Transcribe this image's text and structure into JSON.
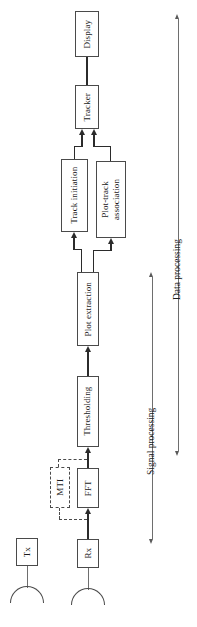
{
  "figure": {
    "type": "block-diagram",
    "orientation": "rotated-90-ccw",
    "background_color": "#ffffff",
    "line_color": "#2b2b2b",
    "box_border_color": "#4a4a4a",
    "blocks": [
      {
        "id": "display",
        "label": "Display",
        "style": "solid"
      },
      {
        "id": "tracker",
        "label": "Tracker",
        "style": "solid"
      },
      {
        "id": "track_init",
        "label": "Track initiation",
        "style": "solid"
      },
      {
        "id": "plot_track",
        "label": "Plot-track association",
        "style": "solid"
      },
      {
        "id": "plot_extract",
        "label": "Plot extraction",
        "style": "solid"
      },
      {
        "id": "thresholding",
        "label": "Thresholding",
        "style": "solid"
      },
      {
        "id": "mti",
        "label": "MTI",
        "style": "dashed"
      },
      {
        "id": "fft",
        "label": "FFT",
        "style": "solid"
      },
      {
        "id": "tx",
        "label": "Tx",
        "style": "solid"
      },
      {
        "id": "rx",
        "label": "Rx",
        "style": "solid"
      }
    ],
    "plot_track_lines": [
      "Plot-track",
      "association"
    ],
    "span_labels": [
      {
        "id": "data_processing",
        "label": "Data processing"
      },
      {
        "id": "signal_processing",
        "label": "Signal processing"
      }
    ],
    "antennas": [
      {
        "id": "tx-antenna"
      },
      {
        "id": "rx-antenna"
      }
    ]
  }
}
